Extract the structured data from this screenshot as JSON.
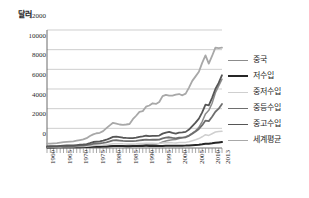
{
  "chart_data": {
    "type": "line",
    "title": "",
    "ylabel": "달러",
    "xlabel": "",
    "ylim": [
      0,
      12000
    ],
    "xlim": [
      1960,
      2013
    ],
    "grid": true,
    "legend_position": "right",
    "yticks": [
      12000,
      10000,
      8000,
      6000,
      4000,
      2000,
      0
    ],
    "ytick_labels": [
      "12000",
      "10000",
      "8000",
      "6000",
      "4000",
      "2000",
      "0"
    ],
    "xticks": [
      1960,
      1965,
      1970,
      1975,
      1980,
      1985,
      1990,
      1995,
      2000,
      2005,
      2010,
      2013
    ],
    "xtick_labels": [
      "1960",
      "1965",
      "1970",
      "1975",
      "1980",
      "1985",
      "1990",
      "1995",
      "2000",
      "2005",
      "2010",
      "2013"
    ],
    "x": [
      1960,
      1961,
      1962,
      1963,
      1964,
      1965,
      1966,
      1967,
      1968,
      1969,
      1970,
      1971,
      1972,
      1973,
      1974,
      1975,
      1976,
      1977,
      1978,
      1979,
      1980,
      1981,
      1982,
      1983,
      1984,
      1985,
      1986,
      1987,
      1988,
      1989,
      1990,
      1991,
      1992,
      1993,
      1994,
      1995,
      1996,
      1997,
      1998,
      1999,
      2000,
      2001,
      2002,
      2003,
      2004,
      2005,
      2006,
      2007,
      2008,
      2009,
      2010,
      2011,
      2012,
      2013
    ],
    "series": [
      {
        "name": "중국",
        "color": "#8c8c8c",
        "width": 1.5,
        "values": [
          90,
          75,
          70,
          74,
          85,
          98,
          104,
          96,
          92,
          100,
          113,
          118,
          131,
          157,
          160,
          178,
          165,
          185,
          156,
          184,
          195,
          197,
          203,
          225,
          250,
          294,
          282,
          252,
          284,
          311,
          318,
          333,
          366,
          377,
          473,
          610,
          709,
          781,
          828,
          873,
          959,
          1053,
          1148,
          1289,
          1509,
          1753,
          2099,
          2694,
          3468,
          3832,
          4550,
          5618,
          6317,
          6995
        ]
      },
      {
        "name": "저수입",
        "color": "#262626",
        "width": 2.0,
        "values": [
          60,
          60,
          62,
          64,
          68,
          72,
          74,
          75,
          77,
          82,
          88,
          90,
          94,
          110,
          126,
          135,
          133,
          146,
          160,
          176,
          196,
          200,
          198,
          195,
          190,
          190,
          196,
          205,
          215,
          215,
          218,
          214,
          213,
          208,
          205,
          215,
          223,
          228,
          232,
          235,
          240,
          240,
          243,
          258,
          285,
          310,
          338,
          382,
          437,
          438,
          472,
          528,
          570,
          610
        ]
      },
      {
        "name": "중저수입",
        "color": "#cfcfcf",
        "width": 1.5,
        "values": [
          95,
          96,
          100,
          105,
          113,
          120,
          125,
          126,
          131,
          142,
          154,
          163,
          181,
          214,
          256,
          272,
          275,
          299,
          334,
          381,
          430,
          443,
          434,
          421,
          416,
          414,
          405,
          420,
          447,
          464,
          486,
          473,
          480,
          469,
          461,
          510,
          545,
          565,
          530,
          520,
          552,
          556,
          571,
          640,
          742,
          846,
          962,
          1142,
          1350,
          1280,
          1450,
          1625,
          1670,
          1700
        ]
      },
      {
        "name": "중등수입",
        "color": "#6e6e6e",
        "width": 1.8,
        "values": [
          130,
          131,
          137,
          146,
          160,
          172,
          182,
          185,
          195,
          214,
          236,
          252,
          285,
          348,
          424,
          456,
          466,
          513,
          580,
          668,
          768,
          790,
          760,
          717,
          705,
          700,
          690,
          722,
          778,
          812,
          852,
          830,
          846,
          840,
          860,
          982,
          1052,
          1092,
          1022,
          983,
          1042,
          1055,
          1090,
          1235,
          1455,
          1680,
          1930,
          2320,
          2790,
          2730,
          3180,
          3690,
          4000,
          4480
        ]
      },
      {
        "name": "중고수입",
        "color": "#565656",
        "width": 1.8,
        "values": [
          175,
          178,
          186,
          200,
          220,
          238,
          252,
          258,
          272,
          300,
          332,
          356,
          404,
          498,
          610,
          658,
          673,
          742,
          842,
          976,
          1128,
          1160,
          1112,
          1044,
          1024,
          1014,
          998,
          1046,
          1132,
          1186,
          1248,
          1214,
          1240,
          1232,
          1268,
          1460,
          1572,
          1638,
          1530,
          1466,
          1560,
          1580,
          1640,
          1870,
          2220,
          2580,
          2985,
          3620,
          4410,
          4330,
          5100,
          6000,
          6620,
          7400
        ]
      },
      {
        "name": "세계평균",
        "color": "#a8a8a8",
        "width": 1.8,
        "values": [
          450,
          455,
          478,
          505,
          548,
          590,
          630,
          655,
          680,
          745,
          810,
          875,
          1000,
          1215,
          1380,
          1500,
          1545,
          1720,
          2015,
          2300,
          2560,
          2480,
          2390,
          2360,
          2390,
          2440,
          2930,
          3280,
          3680,
          3750,
          4200,
          4320,
          4550,
          4480,
          4680,
          5280,
          5400,
          5320,
          5320,
          5420,
          5490,
          5360,
          5530,
          6140,
          6830,
          7280,
          7750,
          8660,
          9420,
          8580,
          9360,
          10200,
          10150,
          10200
        ]
      }
    ]
  },
  "legend": {
    "items": [
      {
        "label": "중국"
      },
      {
        "label": "저수입"
      },
      {
        "label": "중저수입"
      },
      {
        "label": "중등수입"
      },
      {
        "label": "중고수입"
      },
      {
        "label": "세계평균"
      }
    ]
  }
}
